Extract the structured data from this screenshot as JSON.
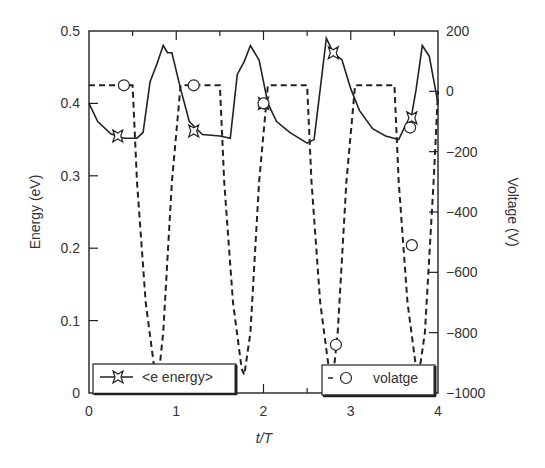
{
  "chart_data": {
    "type": "line",
    "title": "",
    "xlabel": "t/T",
    "ylabel_left": "Energy (eV)",
    "ylabel_right": "Voltage (V)",
    "xlim": [
      0,
      4
    ],
    "ylim_left": [
      0,
      0.5
    ],
    "ylim_right": [
      -1000,
      200
    ],
    "x_ticks": [
      "0",
      "1",
      "2",
      "3",
      "4"
    ],
    "y_left_ticks": [
      "0",
      "0.1",
      "0.2",
      "0.3",
      "0.4",
      "0.5"
    ],
    "y_right_ticks": [
      "200",
      "0",
      "-200",
      "-400",
      "-600",
      "-800",
      "-1000"
    ],
    "grid": false,
    "legend": [
      {
        "label": "<e energy>",
        "style": "solid line with star marker",
        "position": "bottom-left"
      },
      {
        "label": "volatge",
        "style": "dashed line with circle marker",
        "position": "bottom-right"
      }
    ],
    "series": [
      {
        "name": "<e energy>",
        "axis": "left",
        "x": [
          0.0,
          0.1,
          0.25,
          0.4,
          0.55,
          0.62,
          0.7,
          0.78,
          0.85,
          0.9,
          0.95,
          1.05,
          1.15,
          1.3,
          1.5,
          1.62,
          1.7,
          1.78,
          1.85,
          1.95,
          2.05,
          2.15,
          2.3,
          2.5,
          2.58,
          2.67,
          2.72,
          2.8,
          2.9,
          3.0,
          3.1,
          3.25,
          3.4,
          3.55,
          3.62,
          3.7,
          3.75,
          3.82,
          3.9,
          4.0
        ],
        "values": [
          0.4,
          0.375,
          0.358,
          0.352,
          0.352,
          0.36,
          0.43,
          0.455,
          0.48,
          0.47,
          0.47,
          0.42,
          0.375,
          0.357,
          0.355,
          0.352,
          0.44,
          0.458,
          0.48,
          0.46,
          0.4,
          0.375,
          0.36,
          0.345,
          0.35,
          0.44,
          0.49,
          0.47,
          0.46,
          0.42,
          0.39,
          0.365,
          0.355,
          0.35,
          0.368,
          0.385,
          0.42,
          0.48,
          0.465,
          0.4
        ]
      },
      {
        "name": "volatge",
        "axis": "right",
        "x": [
          0.0,
          0.5,
          0.55,
          0.65,
          0.75,
          0.8,
          0.85,
          0.95,
          1.05,
          1.5,
          1.55,
          1.65,
          1.75,
          1.78,
          1.85,
          1.95,
          2.05,
          2.5,
          2.55,
          2.65,
          2.75,
          2.8,
          2.85,
          2.95,
          3.05,
          3.5,
          3.55,
          3.65,
          3.75,
          3.78,
          3.85,
          3.95,
          4.0
        ],
        "values": [
          20,
          20,
          -300,
          -700,
          -920,
          -940,
          -800,
          -300,
          20,
          20,
          -300,
          -700,
          -920,
          -940,
          -800,
          -300,
          20,
          20,
          -300,
          -700,
          -920,
          -940,
          -800,
          -300,
          20,
          20,
          -300,
          -700,
          -920,
          -940,
          -800,
          -300,
          0
        ]
      }
    ],
    "markers": {
      "energy_stars": [
        [
          0.33,
          0.355
        ],
        [
          1.2,
          0.362
        ],
        [
          2.0,
          0.4
        ],
        [
          2.8,
          0.47
        ],
        [
          3.7,
          0.38
        ]
      ],
      "voltage_circles": [
        [
          0.4,
          20
        ],
        [
          1.2,
          20
        ],
        [
          2.0,
          -40
        ],
        [
          2.83,
          -840
        ],
        [
          3.68,
          -120
        ],
        [
          3.7,
          -510
        ]
      ]
    }
  }
}
